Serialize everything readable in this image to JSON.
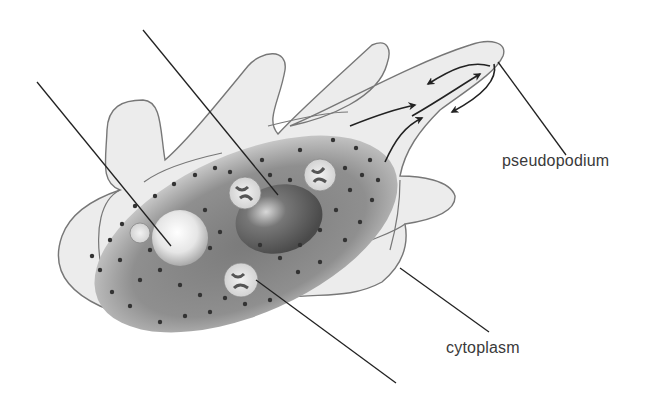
{
  "diagram": {
    "colors": {
      "background": "#ffffff",
      "cell_fill": "#ececec",
      "outline": "#777777",
      "endoplasm_dark": "#6e6e6e",
      "endoplasm_light": "#b5b5b5",
      "granule": "#333333",
      "leader_line": "#222222",
      "label_text": "#3a3a3a"
    },
    "labels": [
      {
        "id": "pseudopodium",
        "text": "pseudopodium",
        "x": 502,
        "y": 161
      },
      {
        "id": "cytoplasm",
        "text": "cytoplasm",
        "x": 446,
        "y": 339
      }
    ],
    "unlabeled_pointers": [
      {
        "id": "nucleus-pointer",
        "from": [
          143,
          30
        ],
        "to": [
          278,
          195
        ]
      },
      {
        "id": "contractile-vacuole-pointer",
        "from": [
          37,
          82
        ],
        "to": [
          171,
          246
        ]
      },
      {
        "id": "food-vacuole-pointer",
        "from": [
          256,
          280
        ],
        "to": [
          396,
          383
        ]
      }
    ],
    "labeled_pointers": [
      {
        "id": "pseudopodium-pointer",
        "from": [
          498,
          62
        ],
        "to": [
          566,
          155
        ]
      },
      {
        "id": "cytoplasm-pointer",
        "from": [
          400,
          268
        ],
        "to": [
          489,
          332
        ]
      }
    ]
  }
}
